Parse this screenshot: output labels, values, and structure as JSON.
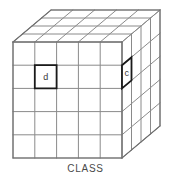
{
  "figure": {
    "title_caption": "CLASS",
    "colors": {
      "background": "#ffffff",
      "grid_line": "#8a8a8a",
      "edge_line": "#6e6e6e",
      "highlight_line": "#1a1a1a",
      "label_text": "#3a3a3a",
      "caption_text": "#4a4a4a"
    },
    "geometry": {
      "front_columns": 5,
      "front_rows": 5,
      "depth_layers": 4,
      "front_left_x": 13,
      "front_top_y": 42,
      "front_right_x": 122,
      "front_bottom_y": 158,
      "depth_dx": 38,
      "depth_dy": -32
    }
  },
  "labels": {
    "front_cell": {
      "text": "d",
      "column": 2,
      "row": 2,
      "name": "front-face-cell-d"
    },
    "side_cell": {
      "text": "c",
      "depth": 1,
      "row": 2,
      "name": "right-face-cell-c"
    }
  },
  "caption": {
    "text": "CLASS"
  }
}
